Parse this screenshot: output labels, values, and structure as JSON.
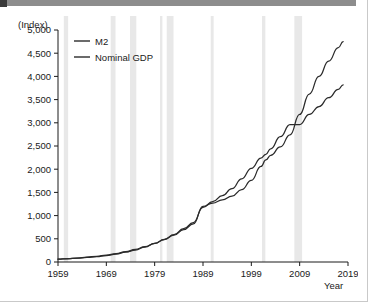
{
  "figure": {
    "unit_label": "(Index)",
    "x_axis_title": "Year",
    "legend": [
      {
        "key": "m2",
        "label": "M2",
        "color": "#2b2b2b"
      },
      {
        "key": "gdp",
        "label": "Nominal GDP",
        "color": "#2b2b2b"
      }
    ]
  },
  "chart_data": {
    "type": "line",
    "title": "",
    "subtitle": "",
    "xlabel": "Year",
    "ylabel": "(Index)",
    "xlim": [
      1959,
      2019
    ],
    "ylim": [
      0,
      5000
    ],
    "xticks": [
      1959,
      1969,
      1979,
      1989,
      1999,
      2009,
      2019
    ],
    "yticks": [
      0,
      500,
      1000,
      1500,
      2000,
      2500,
      3000,
      3500,
      4000,
      4500,
      5000
    ],
    "ytick_labels": [
      "0",
      "500",
      "1,000",
      "1,500",
      "2,000",
      "2,500",
      "3,000",
      "3,500",
      "4,000",
      "4,500",
      "5,000"
    ],
    "xtick_labels": [
      "1959",
      "1969",
      "1979",
      "1989",
      "1999",
      "2009",
      "2019"
    ],
    "grid": false,
    "legend_position": "top-left",
    "note": "Index values; shaded vertical bands mark recession periods",
    "shaded_bands": [
      {
        "label": "recession",
        "start": 1960.2,
        "end": 1961.1
      },
      {
        "label": "recession",
        "start": 1969.9,
        "end": 1970.9
      },
      {
        "label": "recession",
        "start": 1973.9,
        "end": 1975.2
      },
      {
        "label": "recession",
        "start": 1980.1,
        "end": 1980.6
      },
      {
        "label": "recession",
        "start": 1981.5,
        "end": 1982.9
      },
      {
        "label": "recession",
        "start": 1990.6,
        "end": 1991.2
      },
      {
        "label": "recession",
        "start": 2001.2,
        "end": 2001.9
      },
      {
        "label": "recession",
        "start": 2007.9,
        "end": 2009.5
      }
    ],
    "x": [
      1959,
      1961,
      1963,
      1965,
      1967,
      1969,
      1971,
      1973,
      1975,
      1977,
      1979,
      1981,
      1983,
      1985,
      1987,
      1989,
      1991,
      1993,
      1995,
      1997,
      1999,
      2001,
      2002,
      2003,
      2005,
      2007,
      2009,
      2011,
      2013,
      2015,
      2017,
      2018
    ],
    "series": [
      {
        "name": "M2",
        "values": [
          60,
          72,
          86,
          103,
          124,
          148,
          180,
          222,
          270,
          330,
          400,
          480,
          580,
          700,
          820,
          1200,
          1270,
          1340,
          1420,
          1560,
          1760,
          2060,
          2200,
          2300,
          2480,
          2740,
          3180,
          3620,
          4000,
          4330,
          4620,
          4750
        ]
      },
      {
        "name": "Nominal GDP",
        "values": [
          62,
          70,
          82,
          98,
          116,
          140,
          170,
          212,
          258,
          322,
          400,
          490,
          590,
          720,
          850,
          1180,
          1300,
          1430,
          1580,
          1790,
          2020,
          2240,
          2320,
          2440,
          2700,
          2960,
          2960,
          3180,
          3350,
          3540,
          3720,
          3820
        ]
      }
    ]
  }
}
